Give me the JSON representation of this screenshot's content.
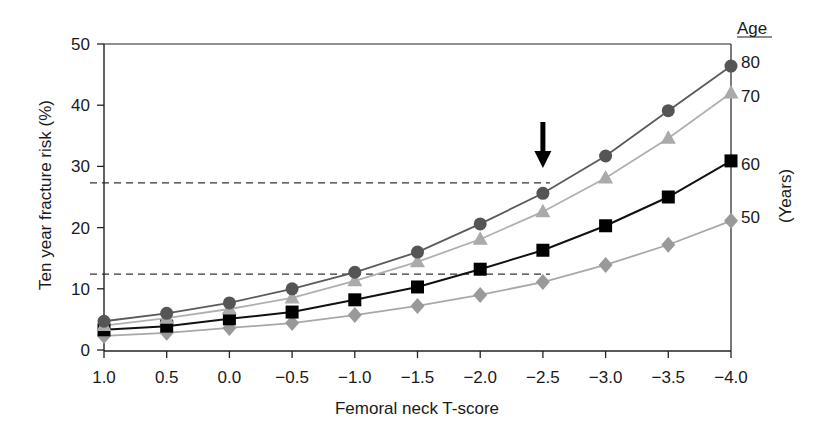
{
  "chart_data": {
    "type": "line",
    "title": "",
    "xlabel": "Femoral neck T-score",
    "ylabel": "Ten year fracture risk (%)",
    "x": [
      1.0,
      0.5,
      0.0,
      -0.5,
      -1.0,
      -1.5,
      -2.0,
      -2.5,
      -3.0,
      -3.5,
      -4.0
    ],
    "x_tick_labels": [
      "1.0",
      "0.5",
      "0.0",
      "−0.5",
      "−1.0",
      "−1.5",
      "−2.0",
      "−2.5",
      "−3.0",
      "−3.5",
      "−4.0"
    ],
    "xlim": [
      1.0,
      -4.0
    ],
    "ylim": [
      0,
      50
    ],
    "y_ticks": [
      0,
      10,
      20,
      30,
      40,
      50
    ],
    "y_tick_labels": [
      "0",
      "10",
      "20",
      "30",
      "40",
      "50"
    ],
    "grid": false,
    "legend": {
      "title": "Age",
      "units_label": "(Years)",
      "placement": "right"
    },
    "series": [
      {
        "name": "80",
        "marker": "circle",
        "line_color": "#5a5a5a",
        "marker_color": "#555555",
        "values": [
          4.7,
          6.0,
          7.7,
          10.0,
          12.7,
          16.0,
          20.6,
          25.6,
          31.7,
          39.1,
          46.4
        ]
      },
      {
        "name": "70",
        "marker": "triangle",
        "line_color": "#b0b0b0",
        "marker_color": "#aaaaaa",
        "values": [
          4.0,
          5.2,
          6.7,
          8.5,
          11.3,
          14.4,
          18.1,
          22.6,
          28.1,
          34.6,
          42.0
        ]
      },
      {
        "name": "60",
        "marker": "square",
        "line_color": "#111111",
        "marker_color": "#000000",
        "values": [
          3.3,
          3.9,
          5.1,
          6.2,
          8.2,
          10.3,
          13.2,
          16.3,
          20.3,
          25.0,
          30.9
        ]
      },
      {
        "name": "50",
        "marker": "diamond",
        "line_color": "#a8a8a8",
        "marker_color": "#999999",
        "values": [
          2.3,
          2.8,
          3.6,
          4.4,
          5.7,
          7.2,
          9.0,
          11.1,
          13.9,
          17.2,
          21.1
        ]
      }
    ],
    "annotations": {
      "reference_lines": [
        {
          "type": "dashed-horizontal",
          "y": 27.3,
          "x_end": -2.5
        },
        {
          "type": "dashed-horizontal",
          "y": 12.4,
          "x_end": -2.5
        }
      ],
      "arrow": {
        "direction": "down",
        "x": -2.5
      }
    }
  }
}
